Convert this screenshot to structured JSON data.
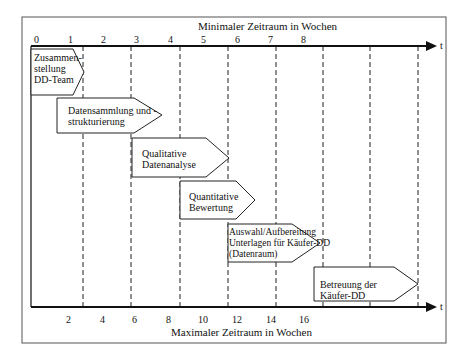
{
  "diagram": {
    "top_axis": {
      "title": "Minimaler Zeitraum in Wochen",
      "ticks": [
        "0",
        "1",
        "2",
        "3",
        "4",
        "5",
        "6",
        "7",
        "8"
      ],
      "arrow_label": "t"
    },
    "bottom_axis": {
      "title": "Maximaler Zeitraum in Wochen",
      "ticks": [
        "2",
        "4",
        "6",
        "8",
        "10",
        "12",
        "14",
        "16"
      ],
      "arrow_label": "t"
    },
    "phases": [
      {
        "lines": [
          "Zusammen-",
          "stellung",
          "DD-Team"
        ]
      },
      {
        "lines": [
          "Datensammlung und -",
          "strukturierung"
        ]
      },
      {
        "lines": [
          "Qualitative",
          "Datenanalyse"
        ]
      },
      {
        "lines": [
          "Quantitative",
          "Bewertung"
        ]
      },
      {
        "lines": [
          "Auswahl/Aufbereitung",
          "Unterlagen für Käufer-DD",
          "(Datenraum)"
        ]
      },
      {
        "lines": [
          "Betreuung der",
          "Käufer-DD"
        ]
      }
    ]
  }
}
